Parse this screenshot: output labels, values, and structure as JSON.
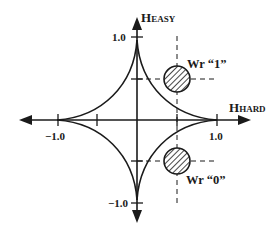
{
  "diagram": {
    "colors": {
      "stroke": "#1a1a1a",
      "background": "#ffffff"
    },
    "axes": {
      "horizontal": {
        "label_main": "H",
        "label_sub": "HARD"
      },
      "vertical": {
        "label_main": "H",
        "label_sub": "EASY"
      }
    },
    "ticks": {
      "x_pos": "1.0",
      "x_neg": "−1.0",
      "y_pos": "1.0",
      "y_neg": "−1.0"
    },
    "points": [
      {
        "id": "write-1",
        "label": "Wr “1”",
        "h_hard": 0.5,
        "h_easy": 0.5
      },
      {
        "id": "write-0",
        "label": "Wr “0”",
        "h_hard": 0.5,
        "h_easy": -0.5
      }
    ],
    "curve": {
      "type": "astroid",
      "radius": 1.0
    }
  }
}
